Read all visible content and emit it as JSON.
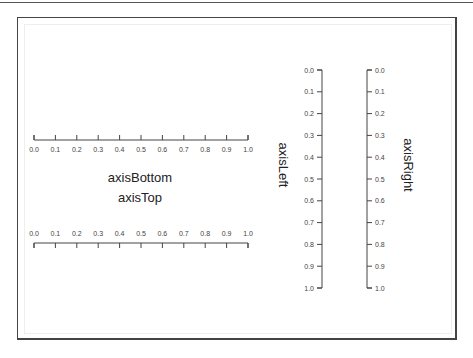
{
  "axes": {
    "bottom": {
      "title": "axisBottom",
      "ticks": [
        "0.0",
        "0.1",
        "0.2",
        "0.3",
        "0.4",
        "0.5",
        "0.6",
        "0.7",
        "0.8",
        "0.9",
        "1.0"
      ]
    },
    "top": {
      "title": "axisTop",
      "ticks": [
        "0.0",
        "0.1",
        "0.2",
        "0.3",
        "0.4",
        "0.5",
        "0.6",
        "0.7",
        "0.8",
        "0.9",
        "1.0"
      ]
    },
    "left": {
      "title": "axisLeft",
      "ticks": [
        "0.0",
        "0.1",
        "0.2",
        "0.3",
        "0.4",
        "0.5",
        "0.6",
        "0.7",
        "0.8",
        "0.9",
        "1.0"
      ]
    },
    "right": {
      "title": "axisRight",
      "ticks": [
        "0.0",
        "0.1",
        "0.2",
        "0.3",
        "0.4",
        "0.5",
        "0.6",
        "0.7",
        "0.8",
        "0.9",
        "1.0"
      ]
    }
  },
  "colors": {
    "axis": "#444444",
    "frame": "#444444",
    "text": "#222222"
  }
}
